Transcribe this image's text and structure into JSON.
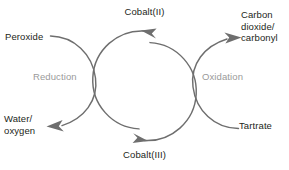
{
  "diagram": {
    "stroke_color": "#6e6e6e",
    "text_color": "#231f20",
    "muted_text_color": "#9a9a9a",
    "background_color": "#ffffff",
    "nodes": {
      "top": "Cobalt(II)",
      "bottom": "Cobalt(III)"
    },
    "inputs": {
      "left": "Peroxide",
      "right": "Tartrate"
    },
    "outputs": {
      "left_line1": "Water/",
      "left_line2": "oxygen",
      "right_line1": "Carbon",
      "right_line2": "dioxide/",
      "right_line3": "carbonyl"
    },
    "half_reactions": {
      "left": "Reduction",
      "right": "Oxidation"
    }
  }
}
